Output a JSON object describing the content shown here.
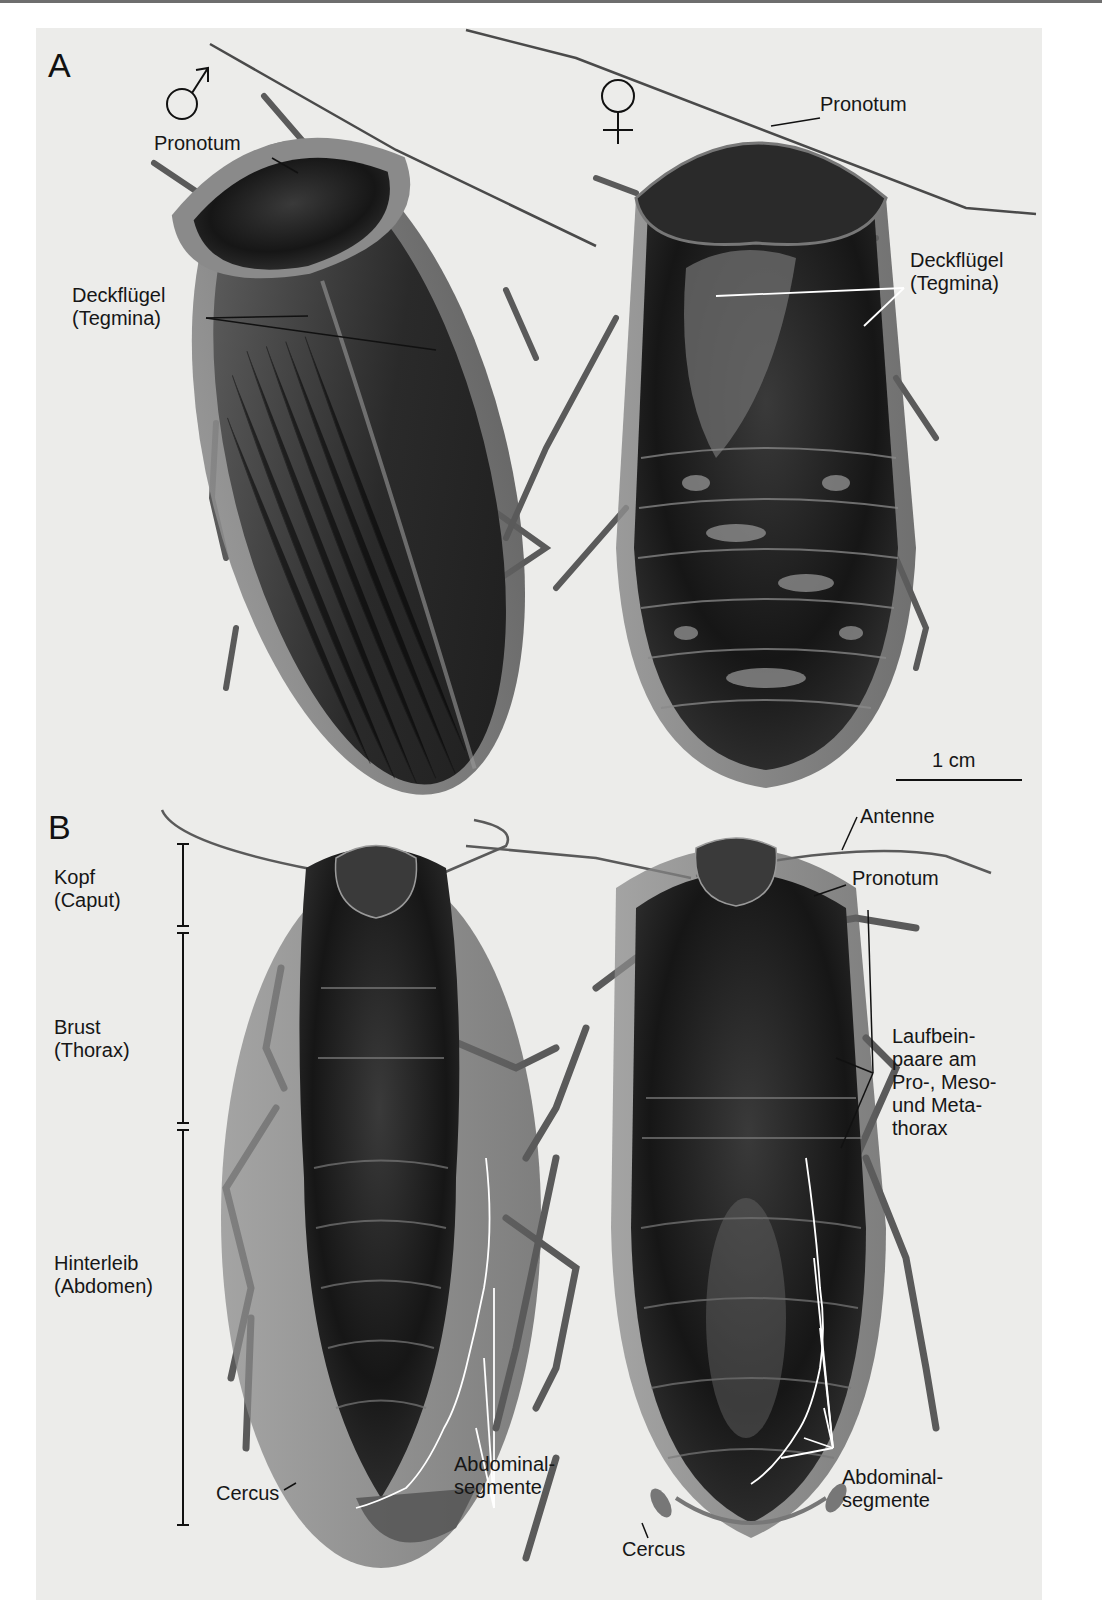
{
  "figure": {
    "panels": [
      {
        "letter": "A",
        "view": "dorsal",
        "specimens": [
          {
            "sex_symbol": "male-symbol",
            "labels": [
              "Pronotum",
              "Deckflügel",
              "(Tegmina)"
            ]
          },
          {
            "sex_symbol": "female-symbol",
            "labels": [
              "Pronotum",
              "Deckflügel",
              "(Tegmina)"
            ]
          }
        ],
        "scale_bar": {
          "label": "1 cm"
        }
      },
      {
        "letter": "B",
        "view": "ventral",
        "body_regions": [
          {
            "name": "Kopf",
            "latin": "(Caput)"
          },
          {
            "name": "Brust",
            "latin": "(Thorax)"
          },
          {
            "name": "Hinterleib",
            "latin": "(Abdomen)"
          }
        ],
        "left_specimen_labels": {
          "cercus": "Cercus",
          "abdominal_1": "Abdominal-",
          "abdominal_2": "segmente"
        },
        "right_specimen_labels": {
          "antenne": "Antenne",
          "pronotum": "Pronotum",
          "legs": [
            "Laufbein-",
            "paare am",
            "Pro-, Meso-",
            "und Meta-",
            "thorax"
          ],
          "abdominal_1": "Abdominal-",
          "abdominal_2": "segmente",
          "cercus": "Cercus"
        }
      }
    ],
    "colors": {
      "background": "#ececea",
      "ink": "#161616",
      "insect_dark": "#1a1a1a",
      "insect_mid": "#4a4a4a",
      "insect_edge": "#8a8a8a"
    }
  }
}
